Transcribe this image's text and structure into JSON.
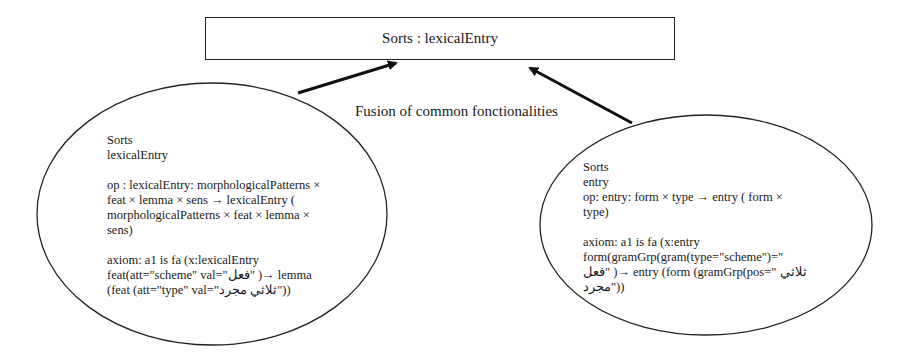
{
  "top_box": {
    "label": "Sorts : lexicalEntry"
  },
  "connector_label": "Fusion of common fonctionalities",
  "left_node": {
    "sorts_heading": "Sorts",
    "sort_name": "lexicalEntry",
    "op": [
      "op : lexicalEntry: morphologicalPatterns ×",
      "feat × lemma × sens → lexicalEntry (",
      "morphologicalPatterns × feat × lemma ×",
      "sens)"
    ],
    "axiom": [
      "axiom: a1 is fa (x:lexicalEntry",
      "feat(att=\"scheme\" val=\"فعل\" )→ lemma",
      "(feat (att=\"type\" val=\"ثلاثي مجرد\"))"
    ]
  },
  "right_node": {
    "sorts_heading": "Sorts",
    "sort_name": "entry",
    "op": [
      "op: entry: form × type → entry ( form ×",
      "type)"
    ],
    "axiom": [
      "axiom: a1 is fa (x:entry",
      "form(gramGrp(gram(type=\"scheme\")=\"",
      "فعل\" )→ entry (form (gramGrp(pos=\" ثلاثي",
      "مجرد\"))"
    ]
  }
}
